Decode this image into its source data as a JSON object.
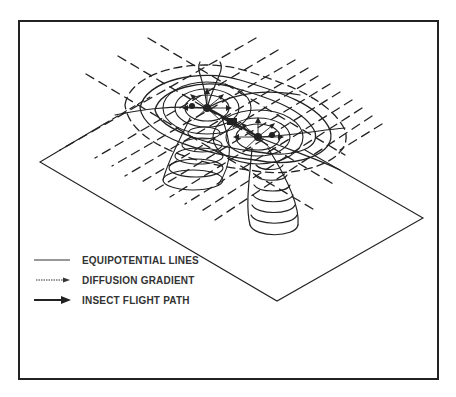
{
  "figure": {
    "colors": {
      "ink": "#222222",
      "background": "#ffffff"
    },
    "elements": {
      "sources": [
        {
          "name": "source-left",
          "cx": 207,
          "cy": 108
        },
        {
          "name": "source-right",
          "cx": 258,
          "cy": 137
        }
      ],
      "insect": {
        "x": 232,
        "y": 122
      }
    }
  },
  "legend": {
    "items": [
      {
        "id": "equipotential",
        "label": "EQUIPOTENTIAL LINES",
        "style": "solid-line"
      },
      {
        "id": "diffusion",
        "label": "DIFFUSION GRADIENT",
        "style": "dotted-arrow"
      },
      {
        "id": "flight",
        "label": "INSECT FLIGHT PATH",
        "style": "bold-arrow"
      }
    ]
  }
}
